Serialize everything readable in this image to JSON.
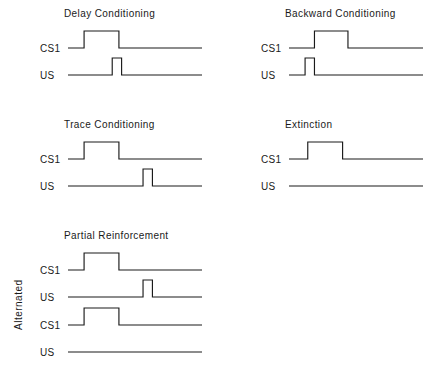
{
  "figure": {
    "width": 442,
    "height": 387,
    "background": "#ffffff",
    "line_color": "#1a1a1a",
    "text_color": "#1a1a1a",
    "side_label": "Alternated"
  },
  "chart_data": {
    "type": "line",
    "title": "",
    "xlabel": "",
    "ylabel": "",
    "grid": false,
    "legend": "none",
    "x_range": [
      0,
      100
    ],
    "y_levels": {
      "low": 0,
      "high": 1
    },
    "panels": [
      {
        "id": "delay-conditioning",
        "title": "Delay Conditioning",
        "column": "left",
        "row": 1,
        "traces": [
          {
            "label": "CS1",
            "pulses": [
              {
                "start": 12,
                "end": 38
              }
            ]
          },
          {
            "label": "US",
            "pulses": [
              {
                "start": 33,
                "end": 40
              }
            ]
          }
        ]
      },
      {
        "id": "backward-conditioning",
        "title": "Backward Conditioning",
        "column": "right",
        "row": 1,
        "traces": [
          {
            "label": "CS1",
            "pulses": [
              {
                "start": 19,
                "end": 44
              }
            ]
          },
          {
            "label": "US",
            "pulses": [
              {
                "start": 12,
                "end": 19
              }
            ]
          }
        ]
      },
      {
        "id": "trace-conditioning",
        "title": "Trace Conditioning",
        "column": "left",
        "row": 2,
        "traces": [
          {
            "label": "CS1",
            "pulses": [
              {
                "start": 12,
                "end": 38
              }
            ]
          },
          {
            "label": "US",
            "pulses": [
              {
                "start": 56,
                "end": 63
              }
            ]
          }
        ]
      },
      {
        "id": "extinction",
        "title": "Extinction",
        "column": "right",
        "row": 2,
        "traces": [
          {
            "label": "CS1",
            "pulses": [
              {
                "start": 14,
                "end": 40
              }
            ]
          },
          {
            "label": "US",
            "pulses": []
          }
        ]
      },
      {
        "id": "partial-reinforcement-trial-a",
        "title": "Partial Reinforcement",
        "column": "left",
        "row": 3,
        "traces": [
          {
            "label": "CS1",
            "pulses": [
              {
                "start": 12,
                "end": 38
              }
            ]
          },
          {
            "label": "US",
            "pulses": [
              {
                "start": 56,
                "end": 63
              }
            ]
          }
        ]
      },
      {
        "id": "partial-reinforcement-trial-b",
        "title": "",
        "column": "left",
        "row": 4,
        "traces": [
          {
            "label": "CS1",
            "pulses": [
              {
                "start": 12,
                "end": 38
              }
            ]
          },
          {
            "label": "US",
            "pulses": []
          }
        ]
      }
    ]
  }
}
